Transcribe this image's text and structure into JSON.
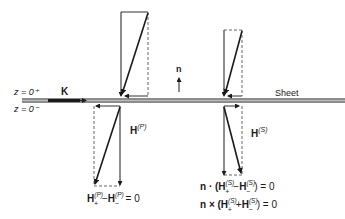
{
  "labels": {
    "z_plus": "z = 0⁺",
    "z_minus": "z = 0⁻",
    "current": "K",
    "normal": "n",
    "sheet": "Sheet",
    "h_p": "H",
    "h_p_sup": "(P)",
    "h_s": "H",
    "h_s_sup": "(S)"
  },
  "equations": {
    "p_condition": {
      "a": "H",
      "a_sup": "(P)",
      "a_sub": "+",
      "op": "−",
      "b": "H",
      "b_sup": "(P)",
      "b_sub": "−",
      "rhs": " = 0"
    },
    "s_condition_dot": {
      "prefix": "n · (",
      "a": "H",
      "a_sup": "(S)",
      "a_sub": "+",
      "op": "−",
      "b": "H",
      "b_sup": "(S)",
      "b_sub": "−",
      "rhs": ") = 0"
    },
    "s_condition_cross": {
      "prefix": "n × (",
      "a": "H",
      "a_sup": "(S)",
      "a_sub": "+",
      "op": "+",
      "b": "H",
      "b_sup": "(S)",
      "b_sub": "−",
      "rhs": ") = 0"
    }
  },
  "colors": {
    "ink": "#1a1a1a",
    "dashed": "#555555"
  }
}
